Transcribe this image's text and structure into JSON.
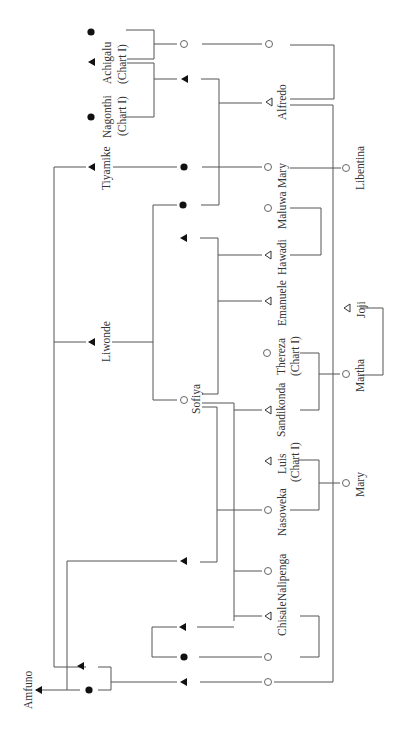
{
  "diagram": {
    "type": "kinship-chart",
    "orientation": "rotated -90deg",
    "line_color": "#555555",
    "symbol_color": "#111111",
    "open_symbol_color": "#666666",
    "legend_symbols": {
      "filled-triangle": "deceased male",
      "open-triangle": "living male",
      "filled-circle": "deceased female",
      "open-circle": "living female"
    }
  },
  "people": {
    "achigalu": {
      "name": "Achigalu",
      "note": "(Chart I)",
      "symbol": "filled-triangle"
    },
    "nagonthi": {
      "name": "Nagonthi",
      "note": "(Chart I)",
      "symbol": "filled-circle"
    },
    "nagonthi_spouse_top": {
      "name": "",
      "symbol": "filled-circle"
    },
    "tiyamike": {
      "name": "Tiyamike",
      "symbol": "filled-triangle"
    },
    "liwonde": {
      "name": "Liwonde",
      "symbol": "filled-triangle"
    },
    "amfuno": {
      "name": "Amfuno",
      "symbol": "filled-triangle"
    },
    "sofiya": {
      "name": "Sofiya",
      "symbol": "open-circle"
    },
    "alfredo": {
      "name": "Alfredo",
      "symbol": "open-triangle"
    },
    "mary1": {
      "name": "Mary",
      "symbol": "open-circle"
    },
    "maluwa": {
      "name": "Maluwa",
      "symbol": "open-circle"
    },
    "hawadi": {
      "name": "Hawadi",
      "symbol": "open-triangle"
    },
    "emanuele": {
      "name": "Emanuele",
      "symbol": "open-triangle"
    },
    "thereza": {
      "name": "Thereza",
      "note": "(Chart I)",
      "symbol": "open-circle"
    },
    "sandikonda": {
      "name": "Sandikonda",
      "symbol": "open-triangle"
    },
    "luis": {
      "name": "Luis",
      "note": "(Chart I)",
      "symbol": "open-triangle"
    },
    "nasoweka": {
      "name": "Nasoweka",
      "symbol": "open-circle"
    },
    "nalipenga": {
      "name": "Nalipenga",
      "symbol": "open-circle"
    },
    "chisale": {
      "name": "Chisale",
      "symbol": "open-triangle"
    },
    "libentina": {
      "name": "Libentina",
      "symbol": "open-circle"
    },
    "joji": {
      "name": "Joji",
      "symbol": "open-triangle"
    },
    "martha": {
      "name": "Martha",
      "symbol": "open-circle"
    },
    "mary2": {
      "name": "Mary",
      "symbol": "open-circle"
    }
  }
}
